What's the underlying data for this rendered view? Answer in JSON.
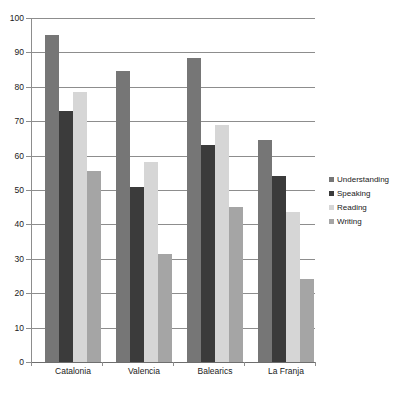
{
  "chart_data": {
    "type": "bar",
    "title": "",
    "subtitle": "",
    "xlabel": "",
    "ylabel": "",
    "ylim": [
      0,
      100
    ],
    "ytick_step": 10,
    "yticks": [
      100,
      90,
      80,
      70,
      60,
      50,
      40,
      30,
      20,
      10,
      0
    ],
    "grid": true,
    "legend_position": "right",
    "categories": [
      "Catalonia",
      "Valencia",
      "Balearics",
      "La Franja"
    ],
    "series": [
      {
        "name": "Understanding",
        "color": "#767676",
        "values": [
          95,
          84.5,
          88.5,
          64.5
        ]
      },
      {
        "name": "Speaking",
        "color": "#3b3b3b",
        "values": [
          73,
          51,
          63,
          54
        ]
      },
      {
        "name": "Reading",
        "color": "#d6d6d6",
        "values": [
          78.5,
          58,
          69,
          43.5
        ]
      },
      {
        "name": "Writing",
        "color": "#a5a5a5",
        "values": [
          55.5,
          31.5,
          45,
          24
        ]
      }
    ]
  }
}
